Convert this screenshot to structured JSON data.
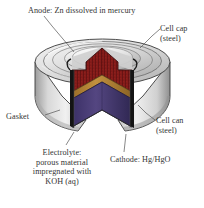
{
  "figure": {
    "background": "#ffffff"
  },
  "labels": {
    "anode": "Anode: Zn dissolved in mercury",
    "cell_cap": "Cell cap\n(steel)",
    "gasket": "Gasket",
    "cell_can": "Cell can\n(steel)",
    "electrolyte": "Electrolyte:\nporous material\nimpregnated with\nKOH (aq)",
    "cathode": "Cathode: Hg/HgO"
  },
  "colors": {
    "anode_zinc": "#8a1a18",
    "anode_zinc_dark": "#5d0f10",
    "electrolyte_gold": "#b8873a",
    "electrolyte_gold_dark": "#7d5a22",
    "cathode_purple": "#4a3d7a",
    "cathode_purple_dark": "#2f2752",
    "gasket_black": "#141414",
    "steel_light": "#e8e8e8",
    "steel_mid": "#c9c9c9",
    "steel_dark": "#9a9a9a",
    "outline": "#3a3a3a",
    "leader_line": "#555555",
    "text": "#343434"
  },
  "parts": [
    {
      "name": "cell-cap",
      "material": "steel",
      "label_key": "cell_cap"
    },
    {
      "name": "cell-can",
      "material": "steel",
      "label_key": "cell_can"
    },
    {
      "name": "anode",
      "material": "Zn dissolved in mercury",
      "label_key": "anode"
    },
    {
      "name": "electrolyte",
      "material": "porous material impregnated with KOH (aq)",
      "label_key": "electrolyte"
    },
    {
      "name": "cathode",
      "material": "Hg/HgO",
      "label_key": "cathode"
    },
    {
      "name": "gasket",
      "material": "insulating gasket",
      "label_key": "gasket"
    }
  ]
}
